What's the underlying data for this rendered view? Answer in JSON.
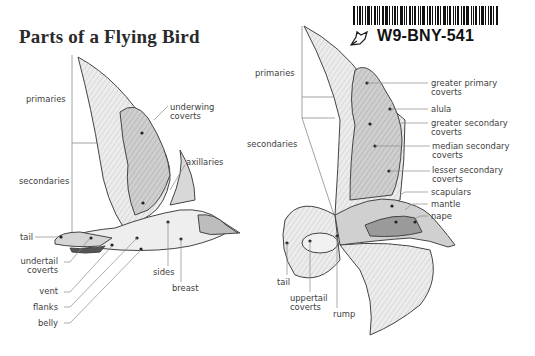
{
  "title": "Parts of a Flying Bird",
  "barcode": {
    "code": "W9-BNY-541",
    "icon": "leaf-outline-icon"
  },
  "underside_bird": {
    "labels": {
      "primaries": "primaries",
      "secondaries": "secondaries",
      "underwing_coverts_1": "underwing",
      "underwing_coverts_2": "coverts",
      "axillaries": "axillaries",
      "tail": "tail",
      "undertail_coverts_1": "undertail",
      "undertail_coverts_2": "coverts",
      "vent": "vent",
      "flanks": "flanks",
      "belly": "belly",
      "sides": "sides",
      "breast": "breast"
    }
  },
  "upperside_bird": {
    "labels": {
      "primaries": "primaries",
      "secondaries": "secondaries",
      "greater_primary_coverts_1": "greater primary",
      "greater_primary_coverts_2": "coverts",
      "alula": "alula",
      "greater_secondary_coverts_1": "greater secondary",
      "greater_secondary_coverts_2": "coverts",
      "median_secondary_coverts_1": "median secondary",
      "median_secondary_coverts_2": "coverts",
      "lesser_secondary_coverts_1": "lesser secondary",
      "lesser_secondary_coverts_2": "coverts",
      "scapulars": "scapulars",
      "mantle": "mantle",
      "nape": "nape",
      "tail": "tail",
      "uppertail_coverts_1": "uppertail",
      "uppertail_coverts_2": "coverts",
      "rump": "rump"
    }
  },
  "colors": {
    "background": "#ffffff",
    "text": "#3d3d3d",
    "feather_light": "#e6e6e6",
    "feather_mid": "#c8c8c8",
    "feather_dark": "#9a9a9a",
    "outline": "#444444",
    "leader_line": "#8a8a8a"
  }
}
